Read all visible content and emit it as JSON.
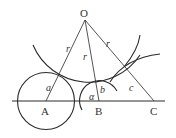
{
  "diagram": {
    "points": {
      "O": {
        "label": "O",
        "x": 85,
        "y": 20
      },
      "A": {
        "label": "A",
        "x": 46,
        "y": 101
      },
      "B": {
        "label": "B",
        "x": 99,
        "y": 101
      },
      "C": {
        "label": "C",
        "x": 154,
        "y": 101
      }
    },
    "segment_labels": {
      "OA": "r",
      "OB": "r",
      "OC": "r",
      "A_radius": "a",
      "B_radius": "b",
      "C_radius": "c",
      "angle": "α"
    },
    "colors": {
      "stroke": "#2a2a2a",
      "text": "#333333",
      "background": "#ffffff"
    }
  }
}
